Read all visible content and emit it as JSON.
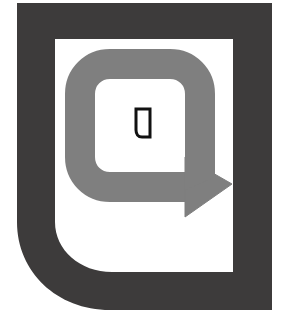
{
  "graphic": {
    "kind": "logo-mark",
    "title": "Rounded bracket logo with loop arrow",
    "alt_text": "Dark gray open bracket frame enclosing a gray rounded loop arrow pointing right, with a small black outlined glyph at the center",
    "canvas": {
      "width": 291,
      "height": 327,
      "background_color": "#ffffff"
    },
    "colors": {
      "background": "#ffffff",
      "frame_dark": "#3d3b3b",
      "loop_arrow_gray": "#7f7f7f",
      "inner_field": "#ffffff",
      "glyph_outline": "#111111"
    },
    "elements": [
      {
        "name": "outer-frame",
        "description": "Thick dark bracket: sharp top-left and top-right corners, large rounded bottom-left corner, sharp bottom-right corner",
        "color": "#3d3b3b",
        "stroke_width_px": 38
      },
      {
        "name": "inner-field",
        "description": "White rectangular field inside the dark frame",
        "color": "#ffffff"
      },
      {
        "name": "loop-arrow",
        "description": "Medium gray rounded-square loop with an arrowhead at the lower right pointing right and down",
        "color": "#7f7f7f",
        "stroke_width_px": 30,
        "corner_radius_px": 34,
        "arrow_direction": "right-down"
      },
      {
        "name": "center-glyph",
        "description": "Small black outlined shape resembling a letter D / flag at the center of the loop",
        "color": "#111111",
        "outline_width_px": 3
      }
    ]
  }
}
